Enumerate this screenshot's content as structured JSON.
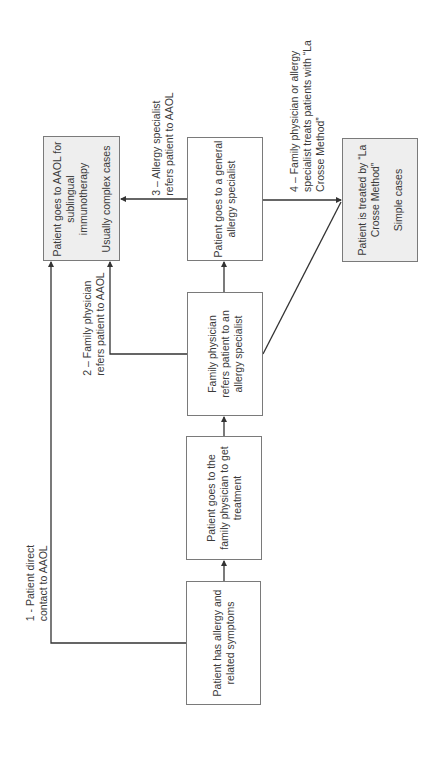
{
  "diagram": {
    "type": "flowchart",
    "orientation": "rotated-90-ccw",
    "colors": {
      "border": "#7a7a7a",
      "gray_fill": "#eeeeee",
      "line": "#333333"
    },
    "nodes": {
      "aaol": {
        "line1": "Patient goes to AAOL for",
        "line2": "sublingual",
        "line3": "immunotherapy",
        "note": "Usually complex cases"
      },
      "general_specialist": {
        "line1": "Patient goes to a general",
        "line2": "allergy specialist"
      },
      "la_crosse": {
        "line1": "Patient is treated by “La",
        "line2": "Crosse Method”",
        "note": "Simple cases"
      },
      "fp_refers": {
        "line1": "Family physician",
        "line2": "refers patient to an",
        "line3": "allergy specialist"
      },
      "family_physician": {
        "line1": "Patient goes to the",
        "line2": "family physician to get",
        "line3": "treatment"
      },
      "has_allergy": {
        "line1": "Patient has allergy and",
        "line2": "related symptoms"
      }
    },
    "edges": {
      "e1": {
        "line1": "1 - Patient direct",
        "line2": "contact to AAOL"
      },
      "e2": {
        "line1": "2 – Family physician",
        "line2": "refers patient to AAOL"
      },
      "e3": {
        "line1": "3 – Allergy specialist",
        "line2": "refers patient to AAOL"
      },
      "e4": {
        "line1": "4 – Family physician or allergy",
        "line2": "specialist treats patients with “La",
        "line3": "Crosse Method”"
      }
    }
  }
}
